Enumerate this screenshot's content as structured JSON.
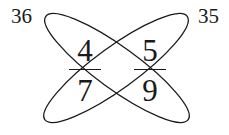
{
  "diagram": {
    "type": "cross-multiplication",
    "products": {
      "left": "36",
      "right": "35"
    },
    "fractions": [
      {
        "numerator": "4",
        "denominator": "7"
      },
      {
        "numerator": "5",
        "denominator": "9"
      }
    ],
    "loops": [
      {
        "connects": [
          "4",
          "9"
        ],
        "product": "36"
      },
      {
        "connects": [
          "5",
          "7"
        ],
        "product": "35"
      }
    ],
    "stroke_color": "#1a1a1a",
    "background": "#ffffff"
  }
}
